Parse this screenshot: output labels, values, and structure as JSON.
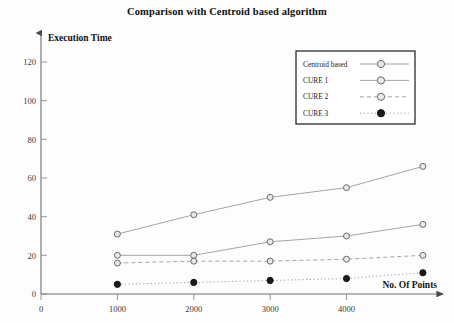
{
  "chart_data": {
    "type": "line",
    "title": "Comparison with Centroid based algorithm",
    "xlabel": "No. Of Points",
    "ylabel": "Execution Time",
    "x": [
      1000,
      2000,
      3000,
      4000,
      5000
    ],
    "xticks": [
      0,
      1000,
      2000,
      3000,
      4000
    ],
    "yticks": [
      0,
      20,
      40,
      60,
      80,
      100,
      120
    ],
    "xlim": [
      0,
      5200
    ],
    "ylim": [
      0,
      130
    ],
    "grid": false,
    "legend_position": "upper-right",
    "series": [
      {
        "name": "Centroid based",
        "values": [
          31,
          41,
          50,
          55,
          66
        ],
        "marker": "open-circle",
        "linestyle": "solid",
        "color": "#9a9a9a"
      },
      {
        "name": "CURE 1",
        "values": [
          20,
          20,
          27,
          30,
          36
        ],
        "marker": "open-circle",
        "linestyle": "solid",
        "color": "#9a9a9a"
      },
      {
        "name": "CURE 2",
        "values": [
          16,
          17,
          17,
          18,
          20
        ],
        "marker": "open-circle",
        "linestyle": "dashed",
        "color": "#9a9a9a"
      },
      {
        "name": "CURE 3",
        "values": [
          5,
          6,
          7,
          8,
          11
        ],
        "marker": "filled-circle",
        "linestyle": "dotted",
        "color": "#1b1b1b"
      }
    ]
  },
  "legend": {
    "entries": [
      {
        "label": "Centroid based"
      },
      {
        "label": "CURE 1"
      },
      {
        "label": "CURE 2"
      },
      {
        "label": "CURE 3"
      }
    ]
  },
  "axes": {
    "y_axis_arrow": "up-arrow-icon",
    "x_axis_arrow": "right-arrow-icon"
  }
}
